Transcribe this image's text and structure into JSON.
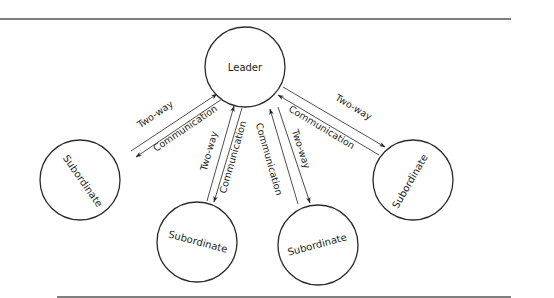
{
  "diagram": {
    "type": "hub-and-spoke communication diagram",
    "colors": {
      "line": "#3a3a3a",
      "node_stroke": "#2b2b2b",
      "text": "#1e1e1e",
      "rule": "#555555",
      "background": "#ffffff"
    },
    "leader": {
      "label": "Leader",
      "cx": 245,
      "cy": 67,
      "r": 40
    },
    "subordinates": [
      {
        "id": "left",
        "label": "Subordinate",
        "cx": 80,
        "cy": 180,
        "r": 40,
        "text_rotation": 55
      },
      {
        "id": "center-left",
        "label": "Subordinate",
        "cx": 197,
        "cy": 242,
        "r": 40,
        "text_rotation": 15
      },
      {
        "id": "center-right",
        "label": "Subordinate",
        "cx": 318,
        "cy": 245,
        "r": 40,
        "text_rotation": -15
      },
      {
        "id": "right",
        "label": "Subordinate",
        "cx": 413,
        "cy": 180,
        "r": 40,
        "text_rotation": -60
      }
    ],
    "links": [
      {
        "to": "left",
        "label_a": "Two-way",
        "label_b": "Communication"
      },
      {
        "to": "center-left",
        "label_a": "Two-way",
        "label_b": "Communication"
      },
      {
        "to": "center-right",
        "label_a": "Communication",
        "label_b": "Two-way"
      },
      {
        "to": "right",
        "label_a": "Two-way",
        "label_b": "Communication"
      }
    ]
  }
}
